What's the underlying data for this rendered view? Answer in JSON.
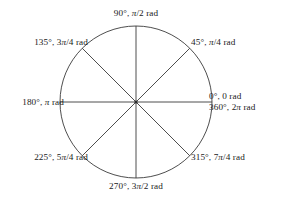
{
  "figure": {
    "name": "unit-circle-angle-reference",
    "background_color": "#ffffff",
    "stroke_color": "#3a3a3a",
    "text_color": "#1a1a1a"
  },
  "circle": {
    "center_x": 136,
    "center_y": 102,
    "radius": 76
  },
  "labels": {
    "deg_90": "90°, π/2 rad",
    "deg_135": "135°, 3π/4 rad",
    "deg_45": "45°, π/4 rad",
    "deg_180": "180°, π rad",
    "deg_0": "0°, 0 rad",
    "deg_360": "360°, 2π rad",
    "deg_225": "225°, 5π/4 rad",
    "deg_315": "315°, 7π/4 rad",
    "deg_270": "270°, 3π/2 rad"
  },
  "chart_data": {
    "type": "scatter",
    "title": "",
    "xlabel": "",
    "ylabel": "",
    "grid": false,
    "legend": "none",
    "angles": [
      {
        "degrees": 0,
        "radians": "0",
        "label": "0°, 0 rad",
        "position": "right"
      },
      {
        "degrees": 360,
        "radians": "2π",
        "label": "360°, 2π rad",
        "position": "right"
      },
      {
        "degrees": 45,
        "radians": "π/4",
        "label": "45°, π/4 rad",
        "position": "upper-right"
      },
      {
        "degrees": 90,
        "radians": "π/2",
        "label": "90°, π/2 rad",
        "position": "top"
      },
      {
        "degrees": 135,
        "radians": "3π/4",
        "label": "135°, 3π/4 rad",
        "position": "upper-left"
      },
      {
        "degrees": 180,
        "radians": "π",
        "label": "180°, π rad",
        "position": "left"
      },
      {
        "degrees": 225,
        "radians": "5π/4",
        "label": "225°, 5π/4 rad",
        "position": "lower-left"
      },
      {
        "degrees": 270,
        "radians": "3π/2",
        "label": "270°, 3π/2 rad",
        "position": "bottom"
      },
      {
        "degrees": 315,
        "radians": "7π/4",
        "label": "315°, 7π/4 rad",
        "position": "lower-right"
      }
    ],
    "diameters_drawn_at_degrees": [
      0,
      45,
      90,
      135
    ]
  }
}
